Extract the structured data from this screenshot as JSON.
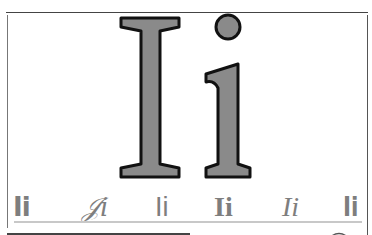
{
  "hero": {
    "glyph_upper": "I",
    "glyph_lower": "i",
    "fill_color": "#8a8a8a",
    "stroke_color": "#111111"
  },
  "samples": [
    {
      "text": "Ii",
      "style": "bold-sans"
    },
    {
      "text": "𝒥i",
      "style": "script"
    },
    {
      "text": "Ii",
      "style": "sans"
    },
    {
      "text": "Ii",
      "style": "bold-serif"
    },
    {
      "text": "Ii",
      "style": "italic-serif"
    },
    {
      "text": "Ii",
      "style": "bold-condensed"
    }
  ],
  "colors": {
    "sample_text": "#7e7e7e",
    "frame": "#444444",
    "rule": "#c8c8c8"
  }
}
